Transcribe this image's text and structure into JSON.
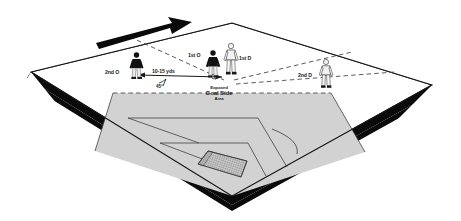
{
  "diagram": {
    "field": {
      "surface_color": "#ffffff",
      "shaded_area_color": "#d2d2d2",
      "base_edge_color": "#0a0a0a",
      "line_color": "#1a1a1a"
    },
    "labels": {
      "second_o": "2nd O",
      "first_o": "1st O",
      "first_d": "1st D",
      "second_d": "2nd D",
      "distance": "10-15 yds",
      "angle": "45°",
      "area_line1": "Exposed",
      "area_line2": "Goal Side",
      "area_line3": "Area"
    },
    "markers": {
      "movement_arrow": "movement-direction-arrow",
      "ball": "soccer-ball"
    },
    "players": [
      {
        "id": "second-o",
        "label": "2nd O",
        "team": "offense",
        "kit": "dark"
      },
      {
        "id": "first-o",
        "label": "1st O",
        "team": "offense",
        "kit": "dark"
      },
      {
        "id": "first-d",
        "label": "1st D",
        "team": "defense",
        "kit": "light"
      },
      {
        "id": "second-d",
        "label": "2nd D",
        "team": "defense",
        "kit": "light"
      }
    ]
  }
}
